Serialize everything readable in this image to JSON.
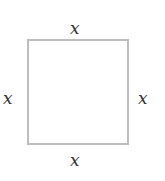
{
  "diagram": {
    "shape": "square",
    "stroke_color": "#bdbdbd",
    "labels": {
      "top": "x",
      "left": "x",
      "right": "x",
      "bottom": "x"
    }
  }
}
